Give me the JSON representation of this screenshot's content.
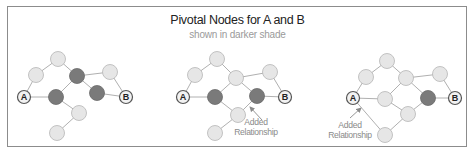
{
  "header": {
    "title": "Pivotal Nodes for A and B",
    "subtitle": "shown in darker shade"
  },
  "colors": {
    "light_node_fill": "#e6e6e6",
    "light_node_stroke": "#b5b5b5",
    "dark_node_fill": "#7a7a7a",
    "edge": "#b0b0b0",
    "annotation": "#8a8a8a",
    "border": "#8c8c8c"
  },
  "panels": [
    {
      "id": "panel-1",
      "nodes": [
        {
          "id": "A",
          "label": "A",
          "x": 24,
          "y": 97,
          "type": "endpoint"
        },
        {
          "id": "top",
          "x": 58,
          "y": 59,
          "type": "light"
        },
        {
          "id": "ul",
          "x": 36,
          "y": 75,
          "type": "light"
        },
        {
          "id": "p1",
          "x": 77,
          "y": 76,
          "type": "dark"
        },
        {
          "id": "ur",
          "x": 110,
          "y": 72,
          "type": "light"
        },
        {
          "id": "B",
          "label": "B",
          "x": 126,
          "y": 97,
          "type": "endpoint"
        },
        {
          "id": "p2",
          "x": 56,
          "y": 97,
          "type": "dark"
        },
        {
          "id": "p3",
          "x": 97,
          "y": 93,
          "type": "dark"
        },
        {
          "id": "low",
          "x": 79,
          "y": 113,
          "type": "light"
        },
        {
          "id": "bot",
          "x": 57,
          "y": 133,
          "type": "light"
        }
      ],
      "edges": [
        [
          "A",
          "ul"
        ],
        [
          "ul",
          "top"
        ],
        [
          "top",
          "p1"
        ],
        [
          "p1",
          "ur"
        ],
        [
          "ur",
          "B"
        ],
        [
          "A",
          "p2"
        ],
        [
          "p2",
          "p1"
        ],
        [
          "p1",
          "p3"
        ],
        [
          "p3",
          "B"
        ],
        [
          "p2",
          "low"
        ],
        [
          "low",
          "bot"
        ]
      ]
    },
    {
      "id": "panel-2",
      "nodes": [
        {
          "id": "A",
          "label": "A",
          "x": 183,
          "y": 97,
          "type": "endpoint"
        },
        {
          "id": "top",
          "x": 217,
          "y": 59,
          "type": "light"
        },
        {
          "id": "ul",
          "x": 195,
          "y": 75,
          "type": "light"
        },
        {
          "id": "mt",
          "x": 236,
          "y": 78,
          "type": "light"
        },
        {
          "id": "ur",
          "x": 270,
          "y": 72,
          "type": "light"
        },
        {
          "id": "B",
          "label": "B",
          "x": 285,
          "y": 97,
          "type": "endpoint"
        },
        {
          "id": "p1",
          "x": 215,
          "y": 97,
          "type": "dark"
        },
        {
          "id": "p2",
          "x": 257,
          "y": 96,
          "type": "dark"
        },
        {
          "id": "low",
          "x": 238,
          "y": 115,
          "type": "light"
        },
        {
          "id": "bot",
          "x": 215,
          "y": 133,
          "type": "light"
        }
      ],
      "edges": [
        [
          "A",
          "ul"
        ],
        [
          "ul",
          "top"
        ],
        [
          "top",
          "mt"
        ],
        [
          "mt",
          "ur"
        ],
        [
          "ur",
          "B"
        ],
        [
          "A",
          "p1"
        ],
        [
          "p1",
          "mt"
        ],
        [
          "mt",
          "p2"
        ],
        [
          "p2",
          "B"
        ],
        [
          "p1",
          "low"
        ],
        [
          "low",
          "p2"
        ],
        [
          "low",
          "bot"
        ]
      ],
      "annotation": {
        "line1": "Added",
        "line2": "Relationship",
        "x": 256,
        "y": 125,
        "arrow_from": [
          262,
          120
        ],
        "arrow_to": [
          250,
          107
        ]
      }
    },
    {
      "id": "panel-3",
      "nodes": [
        {
          "id": "A",
          "label": "A",
          "x": 353,
          "y": 98,
          "type": "endpoint"
        },
        {
          "id": "top",
          "x": 387,
          "y": 61,
          "type": "light"
        },
        {
          "id": "ul",
          "x": 366,
          "y": 77,
          "type": "light"
        },
        {
          "id": "mt",
          "x": 406,
          "y": 78,
          "type": "light"
        },
        {
          "id": "ur",
          "x": 440,
          "y": 74,
          "type": "light"
        },
        {
          "id": "B",
          "label": "B",
          "x": 455,
          "y": 98,
          "type": "endpoint"
        },
        {
          "id": "mid",
          "x": 385,
          "y": 99,
          "type": "light"
        },
        {
          "id": "p1",
          "x": 428,
          "y": 98,
          "type": "dark"
        },
        {
          "id": "low",
          "x": 408,
          "y": 114,
          "type": "light"
        },
        {
          "id": "bot",
          "x": 385,
          "y": 135,
          "type": "light"
        }
      ],
      "edges": [
        [
          "A",
          "ul"
        ],
        [
          "ul",
          "top"
        ],
        [
          "top",
          "mt"
        ],
        [
          "mt",
          "ur"
        ],
        [
          "ur",
          "B"
        ],
        [
          "A",
          "mid"
        ],
        [
          "mid",
          "mt"
        ],
        [
          "mt",
          "p1"
        ],
        [
          "p1",
          "B"
        ],
        [
          "mid",
          "low"
        ],
        [
          "low",
          "p1"
        ],
        [
          "low",
          "bot"
        ],
        [
          "A",
          "bot"
        ]
      ],
      "annotation": {
        "line1": "Added",
        "line2": "Relationship",
        "x": 350,
        "y": 128,
        "arrow_from": [
          350,
          118
        ],
        "arrow_to": [
          361,
          108
        ]
      }
    }
  ]
}
